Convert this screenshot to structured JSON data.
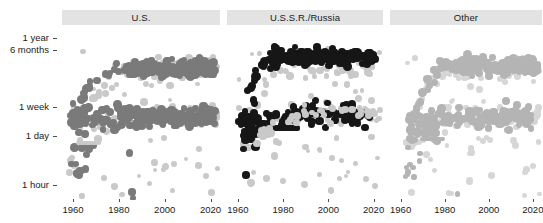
{
  "figure": {
    "background": "#ffffff",
    "strip_color": "#e3e3e3",
    "text_color": "#1a1a1a"
  },
  "chart_data": {
    "type": "scatter",
    "title": "",
    "xlabel": "",
    "ylabel": "",
    "xlim": [
      1955,
      2025
    ],
    "ylim_note": "log time scale from 1 hour to 1 year",
    "grid": false,
    "legend_position": "none",
    "facets": [
      "U.S.",
      "U.S.S.R./Russia",
      "Other"
    ],
    "xticks": [
      1960,
      1980,
      2000,
      2020
    ],
    "xticklabels": [
      "1960",
      "1980",
      "2000",
      "2020"
    ],
    "yticks": [
      "1 hour",
      "1 day",
      "1 week",
      "6 months",
      "1 year"
    ],
    "yticklabels": [
      "1 year",
      "6 months",
      "1 week",
      "1 day",
      "1 hour"
    ],
    "ytick_pixel_y": [
      38,
      50,
      107,
      136,
      185
    ],
    "series": [
      {
        "name": "U.S.",
        "facet": "U.S.",
        "color": "#7a7a7a",
        "background_color": "#c9c9c9",
        "n_points": 300
      },
      {
        "name": "U.S.S.R./Russia",
        "facet": "U.S.S.R./Russia",
        "color": "#161616",
        "background_color": "#c9c9c9",
        "n_points": 300
      },
      {
        "name": "Other",
        "facet": "Other",
        "color": "#b4b4b4",
        "background_color": "#d2d2d2",
        "n_points": 300
      }
    ]
  },
  "panels": [
    {
      "title": "U.S.",
      "left": 62,
      "width": 158
    },
    {
      "title": "U.S.S.R./Russia",
      "left": 227,
      "width": 156
    },
    {
      "title": "Other",
      "left": 390,
      "width": 152
    }
  ],
  "yaxis": {
    "ticks": [
      {
        "label": "1 year",
        "y": 38
      },
      {
        "label": "6 months",
        "y": 50
      },
      {
        "label": "1 week",
        "y": 107
      },
      {
        "label": "1 day",
        "y": 136
      },
      {
        "label": "1 hour",
        "y": 185
      }
    ]
  },
  "xaxis": {
    "labels": [
      "1960",
      "1980",
      "2000",
      "2020"
    ],
    "fractions": [
      0.07,
      0.36,
      0.65,
      0.94
    ]
  }
}
